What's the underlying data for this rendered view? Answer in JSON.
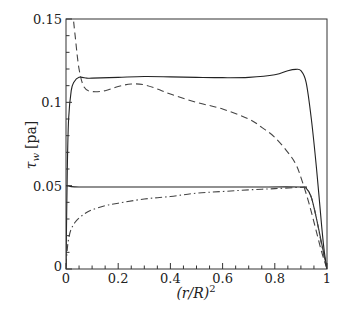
{
  "chart_data": {
    "type": "line",
    "title": "",
    "xlabel": "(r/R)^2",
    "ylabel": "τw [pa]",
    "xlim": [
      0,
      1
    ],
    "ylim": [
      0,
      0.15
    ],
    "x_ticks": [
      0,
      0.2,
      0.4,
      0.6,
      0.8,
      1
    ],
    "x_tick_labels": [
      "0",
      "0.2",
      "0.4",
      "0.6",
      "0.8",
      "1"
    ],
    "y_ticks": [
      0,
      0.05,
      0.1,
      0.15
    ],
    "y_tick_labels": [
      "0",
      "0.05",
      "0.1",
      "0.15"
    ],
    "grid": false,
    "legend": null,
    "series": [
      {
        "name": "solid-upper",
        "style": "solid",
        "x": [
          0.0,
          0.005,
          0.01,
          0.02,
          0.03,
          0.05,
          0.08,
          0.1,
          0.2,
          0.3,
          0.4,
          0.5,
          0.6,
          0.7,
          0.8,
          0.85,
          0.88,
          0.9,
          0.92,
          0.94,
          0.96,
          0.98,
          0.99,
          1.0
        ],
        "y": [
          0.0,
          0.06,
          0.09,
          0.107,
          0.112,
          0.115,
          0.1145,
          0.1145,
          0.115,
          0.1155,
          0.1153,
          0.115,
          0.1148,
          0.115,
          0.1165,
          0.119,
          0.1198,
          0.119,
          0.112,
          0.09,
          0.06,
          0.025,
          0.01,
          0.0
        ]
      },
      {
        "name": "dashed",
        "style": "dashed",
        "x": [
          0.025,
          0.035,
          0.05,
          0.07,
          0.1,
          0.15,
          0.2,
          0.25,
          0.3,
          0.35,
          0.4,
          0.5,
          0.6,
          0.7,
          0.75,
          0.8,
          0.85,
          0.88,
          0.9,
          0.93,
          0.96,
          0.98,
          1.0
        ],
        "y": [
          0.155,
          0.14,
          0.12,
          0.109,
          0.1065,
          0.107,
          0.1095,
          0.111,
          0.1105,
          0.108,
          0.105,
          0.1,
          0.096,
          0.09,
          0.085,
          0.079,
          0.07,
          0.063,
          0.055,
          0.04,
          0.022,
          0.01,
          0.0
        ]
      },
      {
        "name": "solid-lower",
        "style": "solid",
        "x": [
          0.0,
          0.01,
          0.02,
          0.05,
          0.1,
          0.3,
          0.5,
          0.7,
          0.9,
          0.92,
          0.94,
          0.96,
          0.98,
          1.0
        ],
        "y": [
          0.05,
          0.0498,
          0.0494,
          0.0492,
          0.0492,
          0.0492,
          0.0492,
          0.0492,
          0.0492,
          0.0485,
          0.043,
          0.03,
          0.015,
          0.0
        ]
      },
      {
        "name": "dash-dot",
        "style": "dashdot",
        "x": [
          0.0,
          0.005,
          0.01,
          0.02,
          0.04,
          0.07,
          0.1,
          0.15,
          0.2,
          0.3,
          0.4,
          0.5,
          0.6,
          0.7,
          0.8,
          0.9,
          0.92,
          0.94,
          0.96,
          0.98,
          1.0
        ],
        "y": [
          0.002,
          0.012,
          0.018,
          0.024,
          0.029,
          0.033,
          0.0355,
          0.038,
          0.0395,
          0.042,
          0.0435,
          0.0455,
          0.0465,
          0.0475,
          0.0482,
          0.049,
          0.0485,
          0.043,
          0.03,
          0.014,
          0.0
        ]
      }
    ]
  },
  "axes": {
    "x_label_text": "(r/R)",
    "x_label_sup": "2",
    "y_label_symbol": "τ",
    "y_label_sub": "w",
    "y_label_unit": "[pa]"
  }
}
